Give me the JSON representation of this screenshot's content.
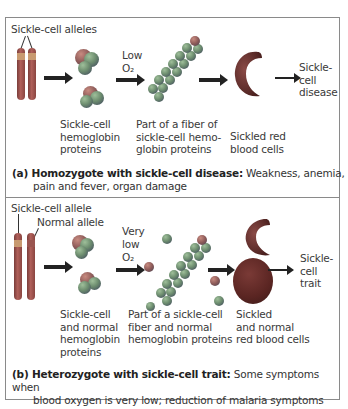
{
  "panel_a": {
    "chromosome_label": "Sickle-cell alleles",
    "condition_line1": "Low",
    "condition_line2": "O₂",
    "step1_caption": [
      "Sickle-cell",
      "hemoglobin",
      "proteins"
    ],
    "step2_caption": [
      "Part of a fiber of",
      "sickle-cell hemo-",
      "globin proteins"
    ],
    "step3_caption": [
      "Sickled red",
      "blood cells"
    ],
    "outcome": [
      "Sickle-",
      "cell",
      "disease"
    ],
    "caption_bold": "(a) Homozygote with sickle-cell disease:",
    "caption_text": " Weakness, anemia,",
    "caption_line2": "pain and fever, organ damage"
  },
  "panel_b": {
    "allele_label_1": "Sickle-cell allele",
    "allele_label_2": "Normal allele",
    "condition_line1": "Very",
    "condition_line2": "low",
    "condition_line3": "O₂",
    "step1_caption": [
      "Sickle-cell",
      "and normal",
      "hemoglobin",
      "proteins"
    ],
    "step2_caption": [
      "Part of a sickle-cell",
      "fiber and normal",
      "hemoglobin proteins"
    ],
    "step3_caption": [
      "Sickled",
      "and normal",
      "red blood cells"
    ],
    "outcome": [
      "Sickle-",
      "cell",
      "trait"
    ],
    "caption_bold": "(b) Heterozygote with sickle-cell trait:",
    "caption_text": " Some symptoms when",
    "caption_line2": "blood oxygen is very low; reduction of malaria symptoms"
  },
  "colors": {
    "chromosome": "#9a4f4a",
    "sickle_band": "#c89a70",
    "protein": "#6d8d6f",
    "red_blood_cell": "#5a2522",
    "arrow": "#222222",
    "frame": "#8a8a8a"
  }
}
